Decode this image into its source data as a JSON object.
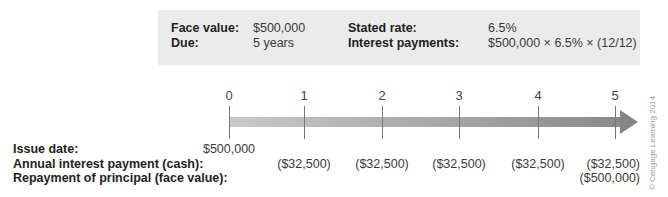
{
  "info": {
    "face_value_label": "Face value:",
    "face_value": "$500,000",
    "due_label": "Due:",
    "due": "5 years",
    "stated_rate_label": "Stated rate:",
    "stated_rate": "6.5%",
    "interest_payments_label": "Interest payments:",
    "interest_payments": "$500,000 × 6.5% × (12/12)"
  },
  "timeline": {
    "ticks": [
      "0",
      "1",
      "2",
      "3",
      "4",
      "5"
    ],
    "bar_color_start": "#c9c9c9",
    "bar_color_end": "#858585"
  },
  "rows": {
    "issue_date_label": "Issue date:",
    "annual_interest_label": "Annual interest payment (cash):",
    "repayment_label": "Repayment of principal (face value):",
    "issue_date_values": [
      "$500,000"
    ],
    "annual_interest_values": [
      "($32,500)",
      "($32,500)",
      "($32,500)",
      "($32,500)",
      "($32,500)"
    ],
    "repayment_values": [
      "($500,000)"
    ]
  },
  "copyright": "© Cengage Learning 2014"
}
